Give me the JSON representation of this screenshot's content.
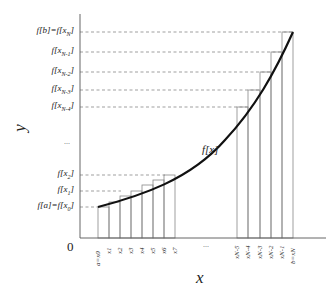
{
  "diagram": {
    "curve_label": "f[x]",
    "axis": {
      "x_title": "x",
      "y_title": "y",
      "origin_label": "0"
    },
    "y_labels": [
      {
        "text": "f[b]=f[x",
        "sub": "N",
        "close": "]"
      },
      {
        "text": "f[x",
        "sub": "N-1",
        "close": "]"
      },
      {
        "text": "f[x",
        "sub": "N-2",
        "close": "]"
      },
      {
        "text": "f[x",
        "sub": "N-3",
        "close": "]"
      },
      {
        "text": "f[x",
        "sub": "N-4",
        "close": "]"
      },
      {
        "text": "...",
        "sub": "",
        "close": ""
      },
      {
        "text": "f[x",
        "sub": "2",
        "close": "]"
      },
      {
        "text": "f[x",
        "sub": "1",
        "close": "]"
      },
      {
        "text": "f[a]=f[x",
        "sub": "0",
        "close": "]"
      }
    ],
    "x_labels_left": [
      "a=x0",
      "x1",
      "x2",
      "x3",
      "x4",
      "x5",
      "x6",
      "x7"
    ],
    "x_labels_right": [
      "xN-5",
      "xN-4",
      "xN-3",
      "xN-2",
      "xN-1",
      "b=xN"
    ],
    "x_ellipsis": "...",
    "colors": {
      "curve": "#111111",
      "rect_stroke": "#888888",
      "axis": "#555555",
      "dashed": "#777777"
    }
  }
}
